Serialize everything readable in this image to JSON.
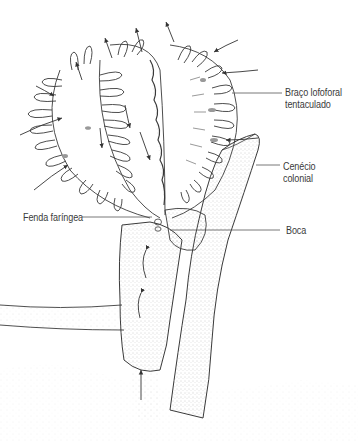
{
  "figure": {
    "background": "#ffffff",
    "line_color": "#3a3a3a",
    "stipple_color": "#9a9a9a"
  },
  "labels": {
    "lophophore_arm": {
      "line1": "Braço lofoforal",
      "line2": "tentaculado"
    },
    "colonial_coenecium": {
      "line1": "Cenécio",
      "line2": "colonial"
    },
    "pharyngeal_slit": {
      "line1": "Fenda faríngea"
    },
    "mouth": {
      "line1": "Boca"
    }
  },
  "arrows": {
    "description": "Water-current arrows: outgoing arrows above the tentacle crown, incoming arrows toward tentacles on both sides, downward flow arrows inside the crown, upward arrows inside the stalk",
    "count_outgoing_top": 4,
    "count_incoming_left": 3,
    "count_incoming_right": 3,
    "count_internal_down": 3,
    "count_stalk_up": 3
  }
}
